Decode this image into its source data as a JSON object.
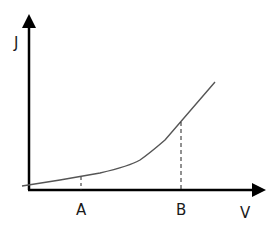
{
  "diagram": {
    "title": "",
    "axes": {
      "x_label": "V",
      "y_label": "J"
    },
    "markers": [
      {
        "label": "A",
        "x_px": 81,
        "curve_y_px": 177
      },
      {
        "label": "B",
        "x_px": 181,
        "curve_y_px": 122
      }
    ],
    "curve": {
      "description": "J-V characteristic: slow linear rise then steeper linear rise",
      "points_px": [
        [
          22,
          186
        ],
        [
          60,
          180
        ],
        [
          100,
          173
        ],
        [
          130,
          165
        ],
        [
          145,
          156
        ],
        [
          165,
          140
        ],
        [
          181,
          122
        ],
        [
          200,
          100
        ],
        [
          215,
          82
        ]
      ]
    },
    "colors": {
      "axis": "#000000",
      "curve": "#555555",
      "dashed": "#222222",
      "text": "#1a1a1a"
    }
  }
}
